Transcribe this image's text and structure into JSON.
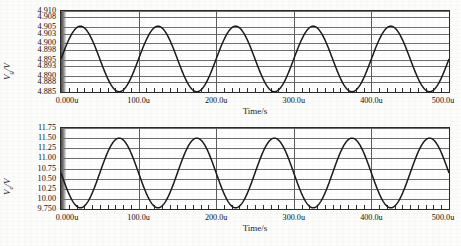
{
  "figure": {
    "background": "#fdfdfb",
    "trace_color": "#1a1a1a",
    "grid_color": "#6f6f6f",
    "axis_color": "#2b2b2b"
  },
  "chart_data": [
    {
      "type": "line",
      "title": "",
      "ylabel": "Vg/V",
      "ylabel_base": "V",
      "ylabel_sub": "g",
      "ylabel_unit": "/V",
      "xlabel": "Time/s",
      "grid": true,
      "legend": "none",
      "xlim": [
        0,
        500
      ],
      "ylim": [
        4.885,
        4.91
      ],
      "x_unit": "u",
      "xticks": [
        0,
        100,
        200,
        300,
        400,
        500
      ],
      "xticklabels": [
        "0.000u",
        "100.0u",
        "200.0u",
        "300.0u",
        "400.0u",
        "500.0u"
      ],
      "x_minor_interval": 10,
      "yticks": [
        4.885,
        4.888,
        4.89,
        4.893,
        4.895,
        4.898,
        4.9,
        4.903,
        4.905,
        4.908,
        4.91
      ],
      "yticklabels": [
        "4.885",
        "4.888",
        "4.890",
        "4.893",
        "4.895",
        "4.898",
        "4.900",
        "4.903",
        "4.905",
        "4.908",
        "4.910"
      ],
      "series": [
        {
          "name": "Vg",
          "waveform": "sine",
          "amplitude": 0.0101,
          "offset": 4.8952,
          "period": 100,
          "phase_deg": 0,
          "start_value": 4.8952,
          "peak_value": 4.9053,
          "trough_value": 4.8851,
          "cycles": 5,
          "first_peak_x": 25,
          "first_trough_x": 75
        }
      ]
    },
    {
      "type": "line",
      "title": "",
      "ylabel": "Ve/V",
      "ylabel_base": "V",
      "ylabel_sub": "e",
      "ylabel_unit": "/V",
      "xlabel": "Time/s",
      "grid": true,
      "legend": "none",
      "xlim": [
        0,
        500
      ],
      "ylim": [
        9.75,
        11.75
      ],
      "x_unit": "u",
      "xticks": [
        0,
        100,
        200,
        300,
        400,
        500
      ],
      "xticklabels": [
        "0.000u",
        "100.0u",
        "200.0u",
        "300.0u",
        "400.0u",
        "500.0u"
      ],
      "x_minor_interval": 10,
      "yticks": [
        9.75,
        10.0,
        10.25,
        10.5,
        10.75,
        11.0,
        11.25,
        11.5,
        11.75
      ],
      "yticklabels": [
        "9.750",
        "10.00",
        "10.25",
        "10.50",
        "10.75",
        "11.00",
        "11.25",
        "11.50",
        "11.75"
      ],
      "series": [
        {
          "name": "Ve",
          "waveform": "sine",
          "amplitude": 0.86,
          "offset": 10.64,
          "period": 100,
          "phase_deg": 180,
          "start_value": 10.64,
          "peak_value": 11.5,
          "trough_value": 9.78,
          "cycles": 5,
          "first_trough_x": 25,
          "first_peak_x": 75
        }
      ]
    }
  ]
}
